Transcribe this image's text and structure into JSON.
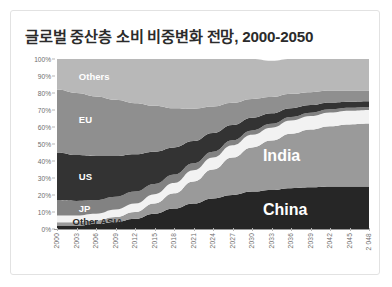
{
  "card": {
    "title": "글로벌 중산층 소비 비중변화 전망, 2000-2050"
  },
  "chart_data": {
    "type": "area",
    "title": "글로벌 중산층 소비 비중변화 전망, 2000-2050",
    "subtitle": "",
    "xlabel": "",
    "ylabel": "",
    "stacked": true,
    "normalized": true,
    "grid": false,
    "legend": "inline-labels",
    "ylim": [
      0,
      100
    ],
    "ytick_labels": [
      "0%",
      "10%",
      "20%",
      "30%",
      "40%",
      "50%",
      "60%",
      "70%",
      "80%",
      "90%",
      "100%"
    ],
    "ytick_values": [
      0,
      10,
      20,
      30,
      40,
      50,
      60,
      70,
      80,
      90,
      100
    ],
    "categories": [
      "2000",
      "2003",
      "2006",
      "2009",
      "2012",
      "2015",
      "2018",
      "2021",
      "2024",
      "2027",
      "2030",
      "2033",
      "2036",
      "2039",
      "2042",
      "2045",
      "2 048"
    ],
    "x": [
      2000,
      2003,
      2006,
      2009,
      2012,
      2015,
      2018,
      2021,
      2024,
      2027,
      2030,
      2033,
      2036,
      2039,
      2042,
      2045,
      2048
    ],
    "series": [
      {
        "name": "China",
        "color": "#262626",
        "label_color": "#ffffff",
        "values": [
          2,
          2,
          3,
          4,
          6,
          9,
          12,
          15,
          18,
          20,
          22,
          23,
          24,
          24.5,
          25,
          25,
          25
        ]
      },
      {
        "name": "India",
        "color": "#9a9a9a",
        "label_color": "#ffffff",
        "values": [
          2,
          2,
          2,
          3,
          4,
          6,
          9,
          13,
          17,
          22,
          26,
          29,
          32,
          34,
          35.5,
          36.5,
          37
        ]
      },
      {
        "name": "Other ASIA",
        "color": "#f2f2f2",
        "label_color": "#2b2b2b",
        "values": [
          4,
          4,
          4,
          4.5,
          5,
          5.5,
          6,
          6.5,
          7,
          7.2,
          7.4,
          7.6,
          7.8,
          7.9,
          8,
          8,
          8
        ]
      },
      {
        "name": "JP",
        "color": "#828282",
        "label_color": "#ffffff",
        "values": [
          9,
          8.5,
          8,
          7.5,
          7,
          6,
          5,
          4.2,
          3.5,
          3,
          2.6,
          2.3,
          2.1,
          2,
          1.9,
          1.8,
          1.8
        ]
      },
      {
        "name": "US",
        "color": "#333333",
        "label_color": "#ffffff",
        "values": [
          28,
          27,
          26,
          24,
          22,
          19,
          16,
          13,
          11,
          9,
          7.5,
          6.2,
          5.2,
          4.5,
          4,
          3.6,
          3.4
        ]
      },
      {
        "name": "EU",
        "color": "#8f8f8f",
        "label_color": "#ffffff",
        "values": [
          37,
          36.5,
          35,
          33,
          30,
          27,
          23,
          19,
          15.5,
          13,
          11,
          9.5,
          8.4,
          7.6,
          7,
          6.6,
          6.3
        ]
      },
      {
        "name": "Others",
        "color": "#b8b8b8",
        "label_color": "#ffffff",
        "values": [
          18,
          20,
          22,
          24,
          26,
          27.5,
          29,
          29.3,
          28,
          25.8,
          23.5,
          21.4,
          20.5,
          19.5,
          18.6,
          18.5,
          18.5
        ]
      }
    ],
    "annotations": [
      {
        "text": "Others",
        "x_pct": 7,
        "y_pct": 90,
        "color": "#ffffff",
        "size": 9.5
      },
      {
        "text": "EU",
        "x_pct": 7,
        "y_pct": 65,
        "color": "#ffffff",
        "size": 9.5
      },
      {
        "text": "US",
        "x_pct": 7,
        "y_pct": 31,
        "color": "#ffffff",
        "size": 9.5
      },
      {
        "text": "JP",
        "x_pct": 7,
        "y_pct": 12.5,
        "color": "#ffffff",
        "size": 9.5
      },
      {
        "text": "Other ASIA",
        "x_pct": 5,
        "y_pct": 5,
        "color": "#2b2b2b",
        "size": 9.5
      },
      {
        "text": "India",
        "x_pct": 66,
        "y_pct": 43,
        "color": "#ffffff",
        "size": 16
      },
      {
        "text": "China",
        "x_pct": 66,
        "y_pct": 11,
        "color": "#ffffff",
        "size": 16
      }
    ]
  }
}
